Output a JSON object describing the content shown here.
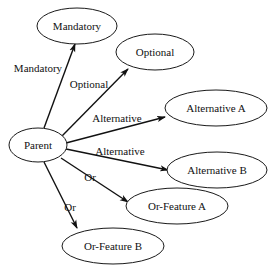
{
  "diagram": {
    "type": "directed-graph",
    "canvas": {
      "width": 271,
      "height": 272
    },
    "style": {
      "background": "#ffffff",
      "node_fill": "#ffffff",
      "node_stroke": "#1a1a1a",
      "edge_color": "#111111",
      "text_color": "#111111"
    },
    "nodes": [
      {
        "id": "parent",
        "label": "Parent",
        "cx": 38,
        "cy": 145,
        "rx": 29,
        "ry": 17
      },
      {
        "id": "mandatory",
        "label": "Mandatory",
        "cx": 77,
        "cy": 26,
        "rx": 40,
        "ry": 18
      },
      {
        "id": "optional",
        "label": "Optional",
        "cx": 155,
        "cy": 52,
        "rx": 39,
        "ry": 18
      },
      {
        "id": "alternative-a",
        "label": "Alternative A",
        "cx": 216,
        "cy": 108,
        "rx": 51,
        "ry": 18
      },
      {
        "id": "alternative-b",
        "label": "Alternative B",
        "cx": 217,
        "cy": 170,
        "rx": 50,
        "ry": 18
      },
      {
        "id": "or-feature-a",
        "label": "Or-Feature A",
        "cx": 177,
        "cy": 206,
        "rx": 51,
        "ry": 18
      },
      {
        "id": "or-feature-b",
        "label": "Or-Feature B",
        "cx": 113,
        "cy": 246,
        "rx": 51,
        "ry": 18
      }
    ],
    "edges": [
      {
        "id": "edge-mandatory",
        "from": "parent",
        "to": "mandatory",
        "label": "Mandatory",
        "x1": 44,
        "y1": 128,
        "x2": 75,
        "y2": 44,
        "label_x": 38,
        "label_y": 69
      },
      {
        "id": "edge-optional",
        "from": "parent",
        "to": "optional",
        "label": "Optional",
        "x1": 62,
        "y1": 136,
        "x2": 128,
        "y2": 69,
        "label_x": 89,
        "label_y": 85
      },
      {
        "id": "edge-alternative-a",
        "from": "parent",
        "to": "alternative-a",
        "label": "Alternative",
        "x1": 66,
        "y1": 143,
        "x2": 165,
        "y2": 117,
        "label_x": 117,
        "label_y": 119
      },
      {
        "id": "edge-alternative-b",
        "from": "parent",
        "to": "alternative-b",
        "label": "Alternative",
        "x1": 66,
        "y1": 149,
        "x2": 168,
        "y2": 170,
        "label_x": 120,
        "label_y": 152
      },
      {
        "id": "edge-or-feature-a",
        "from": "parent",
        "to": "or-feature-a",
        "label": "Or",
        "x1": 61,
        "y1": 158,
        "x2": 128,
        "y2": 202,
        "label_x": 90,
        "label_y": 178
      },
      {
        "id": "edge-or-feature-b",
        "from": "parent",
        "to": "or-feature-b",
        "label": "Or",
        "x1": 44,
        "y1": 162,
        "x2": 77,
        "y2": 228,
        "label_x": 70,
        "label_y": 208
      }
    ]
  }
}
